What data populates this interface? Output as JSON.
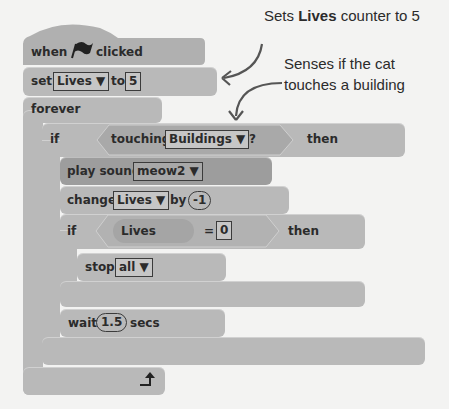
{
  "script": {
    "hat": {
      "when": "when",
      "clicked": "clicked",
      "icon": "green-flag-icon"
    },
    "set": {
      "label": "set",
      "var": "Lives ▼",
      "to": "to",
      "value": "5"
    },
    "forever": {
      "label": "forever"
    },
    "if_touching": {
      "if": "if",
      "touching": "touching",
      "target": "Buildings ▼",
      "q": "?",
      "then": "then"
    },
    "play_sound": {
      "label": "play sound",
      "sound": "meow2 ▼"
    },
    "change": {
      "label": "change",
      "var": "Lives ▼",
      "by": "by",
      "value": "-1"
    },
    "if_lives": {
      "if": "if",
      "var": "Lives",
      "eq": "=",
      "value": "0",
      "then": "then"
    },
    "stop": {
      "label": "stop",
      "option": "all ▼"
    },
    "wait": {
      "label": "wait",
      "value": "1.5",
      "secs": "secs"
    },
    "loop_icon": "loop-arrow-icon"
  },
  "annotations": {
    "note1_pre": "Sets ",
    "note1_bold": "Lives",
    "note1_post": " counter to 5",
    "note2_line1": "Senses if the cat",
    "note2_line2": "touches a building"
  },
  "colors": {
    "block": "#b9b9b9",
    "sound_block": "#9d9d9d",
    "background": "#f3f3f2"
  }
}
